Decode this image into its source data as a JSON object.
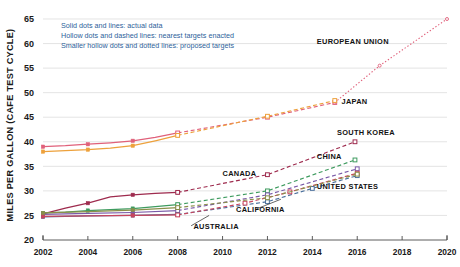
{
  "chart_data": {
    "type": "line",
    "title": "",
    "xlabel": "",
    "ylabel": "MILES PER GALLON (CAFE TEST CYCLE)",
    "xlim": [
      2002,
      2020
    ],
    "ylim": [
      20,
      65
    ],
    "xticks": [
      "2002",
      "2004",
      "2006",
      "2008",
      "2010",
      "2012",
      "2014",
      "2016",
      "2018",
      "2020"
    ],
    "yticks": [
      "20",
      "25",
      "30",
      "35",
      "40",
      "45",
      "50",
      "55",
      "60",
      "65"
    ],
    "grid": true,
    "legend_position": "top-left",
    "legend": [
      "Solid dots and lines: actual data",
      "Hollow dots and dashed lines: nearest targets enacted",
      "Smaller hollow dots and dotted lines: proposed targets"
    ],
    "series": [
      {
        "name": "EUROPEAN UNION",
        "color": "#e0607a",
        "label_x": 2014.2,
        "label_y": 60.0,
        "actual": {
          "x": [
            2002,
            2003,
            2004,
            2005,
            2006,
            2007,
            2008
          ],
          "y": [
            39.0,
            39.2,
            39.5,
            39.8,
            40.2,
            40.9,
            41.8
          ]
        },
        "enacted": {
          "x": [
            2008,
            2012,
            2015
          ],
          "y": [
            41.8,
            45.0,
            48.0
          ]
        },
        "proposed": {
          "x": [
            2015,
            2017,
            2020
          ],
          "y": [
            48.0,
            55.5,
            65.0
          ]
        }
      },
      {
        "name": "JAPAN",
        "color": "#eda13c",
        "label_x": 2015.3,
        "label_y": 47.6,
        "actual": {
          "x": [
            2002,
            2003,
            2004,
            2005,
            2006,
            2007,
            2008
          ],
          "y": [
            38.0,
            38.2,
            38.4,
            38.7,
            39.2,
            40.2,
            41.3
          ]
        },
        "enacted": {
          "x": [
            2008,
            2012,
            2015
          ],
          "y": [
            41.3,
            45.2,
            48.4
          ]
        },
        "proposed": {
          "x": [],
          "y": []
        }
      },
      {
        "name": "SOUTH KOREA",
        "color": "#9e2b4e",
        "label_x": 2015.1,
        "label_y": 41.3,
        "actual": {
          "x": [
            2002,
            2003,
            2004,
            2005,
            2006,
            2007,
            2008
          ],
          "y": [
            25.3,
            26.5,
            27.5,
            28.8,
            29.2,
            29.5,
            29.7
          ]
        },
        "enacted": {
          "x": [
            2008,
            2012,
            2015.9
          ],
          "y": [
            29.7,
            33.3,
            40.0
          ]
        },
        "proposed": {
          "x": [],
          "y": []
        }
      },
      {
        "name": "CHINA",
        "color": "#3e9b5f",
        "label_x": 2014.2,
        "label_y": 36.4,
        "actual": {
          "x": [
            2002,
            2003,
            2004,
            2005,
            2006,
            2007,
            2008
          ],
          "y": [
            25.5,
            25.7,
            26.0,
            26.2,
            26.4,
            26.8,
            27.2
          ]
        },
        "enacted": {
          "x": [
            2008,
            2012,
            2015.9
          ],
          "y": [
            27.2,
            30.0,
            36.3
          ]
        },
        "proposed": {
          "x": [],
          "y": []
        }
      },
      {
        "name": "CANADA",
        "color": "#7a5aa8",
        "label_x": 2010.0,
        "label_y": 33.1,
        "actual": {
          "x": [
            2002,
            2004,
            2006,
            2008
          ],
          "y": [
            25.2,
            25.4,
            25.6,
            26.0
          ]
        },
        "enacted": {
          "x": [
            2008,
            2012,
            2016
          ],
          "y": [
            26.0,
            29.2,
            34.5
          ]
        },
        "proposed": {
          "x": [],
          "y": []
        }
      },
      {
        "name": "UNITED STATES",
        "color": "#4a6f9c",
        "label_x": 2014.2,
        "label_y": 30.4,
        "actual": {
          "x": [
            2002,
            2004,
            2006,
            2008
          ],
          "y": [
            24.7,
            24.9,
            25.0,
            25.2
          ]
        },
        "enacted": {
          "x": [
            2008,
            2012,
            2014,
            2016
          ],
          "y": [
            25.2,
            27.8,
            30.5,
            33.1
          ]
        },
        "proposed": {
          "x": [],
          "y": []
        }
      },
      {
        "name": "CALIFORNIA",
        "color": "#c8455e",
        "label_x": 2010.6,
        "label_y": 25.6,
        "actual": {
          "x": [
            2002,
            2004,
            2006,
            2008
          ],
          "y": [
            24.8,
            24.9,
            25.0,
            25.1
          ]
        },
        "enacted": {
          "x": [
            2008,
            2011,
            2013,
            2016
          ],
          "y": [
            25.1,
            27.5,
            29.8,
            33.6
          ]
        },
        "proposed": {
          "x": [],
          "y": []
        }
      },
      {
        "name": "AUSTRALIA",
        "color": "#8a8f4a",
        "label_x": 2008.7,
        "label_y": 22.2,
        "actual": {
          "x": [
            2002,
            2004,
            2006,
            2008
          ],
          "y": [
            25.5,
            25.8,
            26.1,
            26.6
          ]
        },
        "enacted": {
          "x": [
            2008,
            2012,
            2016
          ],
          "y": [
            26.6,
            28.6,
            33.4
          ]
        },
        "proposed": {
          "x": [],
          "y": []
        }
      }
    ],
    "annotation_leaders": [
      {
        "name": "australia-leader",
        "x1": 2008.6,
        "y1": 22.9,
        "x2": 2009.4,
        "y2": 25.0
      },
      {
        "name": "california-leader",
        "x1": 2011.5,
        "y1": 26.3,
        "x2": 2012.6,
        "y2": 28.3
      }
    ]
  }
}
